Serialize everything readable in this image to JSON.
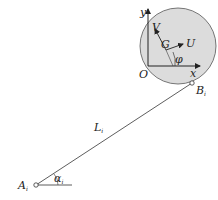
{
  "diagram": {
    "type": "kinematic-link-diagram",
    "colors": {
      "circle_fill": "#dcdcdc",
      "circle_stroke": "#555555",
      "line": "#333333",
      "text": "#222222"
    },
    "labels": {
      "y_axis": "y",
      "x_axis": "x",
      "origin": "O",
      "center": "G",
      "u_vector": "U",
      "v_vector": "V",
      "phi": "φ",
      "link": "L",
      "link_sub": "i",
      "point_a": "A",
      "point_a_sub": "i",
      "point_b": "B",
      "point_b_sub": "i",
      "alpha": "α",
      "alpha_sub": "i"
    }
  }
}
